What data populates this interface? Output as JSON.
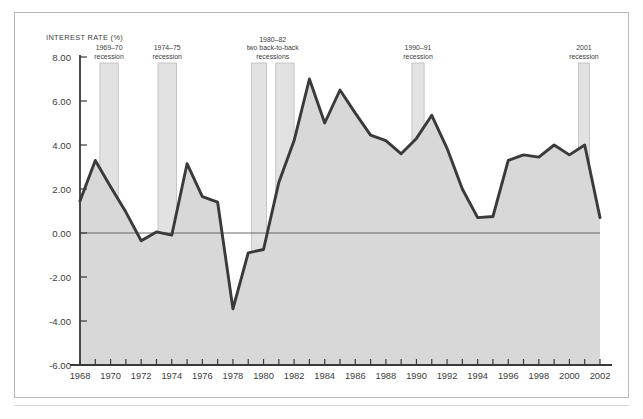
{
  "chart_data": {
    "type": "area",
    "title": "",
    "subtitle": "",
    "ylabel": "INTEREST RATE (%)",
    "xlabel": "",
    "ylim": [
      -6.0,
      8.0
    ],
    "xlim": [
      1968,
      2002
    ],
    "grid": false,
    "legend": "none",
    "y_ticks": [
      "8.00",
      "6.00",
      "4.00",
      "2.00",
      "0.00",
      "-2.00",
      "-4.00",
      "-6.00"
    ],
    "y_tick_values": [
      8,
      6,
      4,
      2,
      0,
      -2,
      -4,
      -6
    ],
    "x_ticks": [
      "1968",
      "1970",
      "1972",
      "1974",
      "1976",
      "1978",
      "1980",
      "1982",
      "1984",
      "1986",
      "1988",
      "1990",
      "1992",
      "1994",
      "1996",
      "1998",
      "2000",
      "2002"
    ],
    "x_tick_values": [
      1968,
      1970,
      1972,
      1974,
      1976,
      1978,
      1980,
      1982,
      1984,
      1986,
      1988,
      1990,
      1992,
      1994,
      1996,
      1998,
      2000,
      2002
    ],
    "x_minor_step": 1,
    "series": [
      {
        "name": "Interest rate",
        "x": [
          1968,
          1969,
          1970,
          1971,
          1972,
          1973,
          1974,
          1975,
          1976,
          1977,
          1978,
          1979,
          1980,
          1981,
          1982,
          1983,
          1984,
          1985,
          1986,
          1987,
          1988,
          1989,
          1990,
          1991,
          1992,
          1993,
          1994,
          1995,
          1996,
          1997,
          1998,
          1999,
          2000,
          2001,
          2002
        ],
        "values": [
          1.45,
          3.3,
          2.1,
          0.95,
          -0.35,
          0.05,
          -0.1,
          3.15,
          1.65,
          1.4,
          -3.45,
          -0.9,
          -0.75,
          2.3,
          4.2,
          7.0,
          5.0,
          6.5,
          5.45,
          4.45,
          4.2,
          3.6,
          4.3,
          5.35,
          3.85,
          2.0,
          0.7,
          0.75,
          3.3,
          3.55,
          3.45,
          4.0,
          3.55,
          4.0,
          0.7
        ],
        "color": "#3a3a3a",
        "fill_color": "#d8d8d8"
      }
    ],
    "annotations": [
      {
        "id": "recession-1969-70",
        "lines": [
          "1969–70",
          "recession"
        ],
        "band_start": 1969.3,
        "band_end": 1970.5
      },
      {
        "id": "recession-1974-75",
        "lines": [
          "1974–75",
          "recession"
        ],
        "band_start": 1973.1,
        "band_end": 1974.3
      },
      {
        "id": "recession-1980-82",
        "lines": [
          "1980–82",
          "two back-to-back",
          "recessions"
        ],
        "band_start": 1979.2,
        "band_end": 1980.2,
        "band2_start": 1980.8,
        "band2_end": 1982.0
      },
      {
        "id": "recession-1990-91",
        "lines": [
          "1990–91",
          "recession"
        ],
        "band_start": 1989.7,
        "band_end": 1990.5
      },
      {
        "id": "recession-2001",
        "lines": [
          "2001",
          "recession"
        ],
        "band_start": 2000.6,
        "band_end": 2001.3
      }
    ],
    "colors": {
      "line": "#3a3a3a",
      "area_fill": "#d8d8d8",
      "recession_band": "#e2e2e2",
      "recession_band_border": "#b4b4b4",
      "axis": "#3a3a3a",
      "frame": "#b9b9b9",
      "text": "#3c3c3c",
      "background": "#ffffff"
    }
  }
}
